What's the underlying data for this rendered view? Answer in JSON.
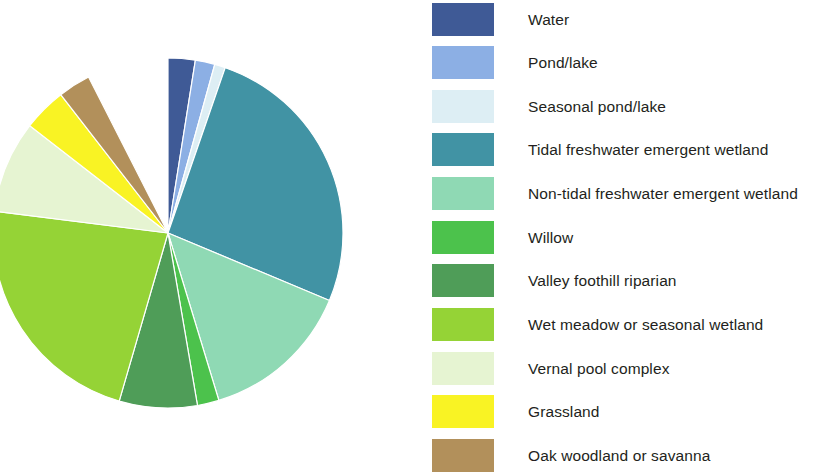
{
  "chart_data": {
    "type": "pie",
    "title": "",
    "subtitle": "",
    "xlabel": "",
    "ylabel": "",
    "legend_position": "right",
    "grid": false,
    "start_angle_deg": 0,
    "direction": "clockwise",
    "categories": [
      "Water",
      "Pond/lake",
      "Seasonal pond/lake",
      "Tidal freshwater emergent wetland",
      "Non-tidal freshwater emergent wetland",
      "Willow",
      "Valley foothill riparian",
      "Wet meadow or seasonal wetland",
      "Vernal pool complex",
      "Grassland",
      "Oak woodland or savanna"
    ],
    "values": [
      2.5,
      1.8,
      1.0,
      26.0,
      14.0,
      2.0,
      7.2,
      22.5,
      8.5,
      4.0,
      3.0
    ],
    "colors": [
      "#3f5a96",
      "#8cafe4",
      "#ddeef4",
      "#4193a4",
      "#8fd9b4",
      "#4cc24c",
      "#4f9d58",
      "#95d336",
      "#e6f4d2",
      "#f9f324",
      "#b2905b"
    ],
    "slices": [
      {
        "label": "Water",
        "value": 2.5,
        "color": "#3f5a96",
        "start_deg": 0.0,
        "end_deg": 9.0
      },
      {
        "label": "Pond/lake",
        "value": 1.8,
        "color": "#8cafe4",
        "start_deg": 9.0,
        "end_deg": 15.5
      },
      {
        "label": "Seasonal pond/lake",
        "value": 1.0,
        "color": "#ddeef4",
        "start_deg": 15.5,
        "end_deg": 19.1
      },
      {
        "label": "Tidal freshwater emergent wetland",
        "value": 26.0,
        "color": "#4193a4",
        "start_deg": 19.1,
        "end_deg": 112.7
      },
      {
        "label": "Non-tidal freshwater emergent wetland",
        "value": 14.0,
        "color": "#8fd9b4",
        "start_deg": 112.7,
        "end_deg": 163.1
      },
      {
        "label": "Willow",
        "value": 2.0,
        "color": "#4cc24c",
        "start_deg": 163.1,
        "end_deg": 170.3
      },
      {
        "label": "Valley foothill riparian",
        "value": 7.2,
        "color": "#4f9d58",
        "start_deg": 170.3,
        "end_deg": 196.2
      },
      {
        "label": "Wet meadow or seasonal wetland",
        "value": 22.5,
        "color": "#95d336",
        "start_deg": 196.2,
        "end_deg": 277.2
      },
      {
        "label": "Vernal pool complex",
        "value": 8.5,
        "color": "#e6f4d2",
        "start_deg": 277.2,
        "end_deg": 307.8
      },
      {
        "label": "Grassland",
        "value": 4.0,
        "color": "#f9f324",
        "start_deg": 307.8,
        "end_deg": 322.2
      },
      {
        "label": "Oak woodland or savanna",
        "value": 3.0,
        "color": "#b2905b",
        "start_deg": 322.2,
        "end_deg": 333.0
      }
    ]
  },
  "pie": {
    "center_x": 168,
    "center_y": 233,
    "radius": 175
  },
  "legend": {
    "items": [
      {
        "label": "Water",
        "color": "#3f5a96",
        "y": 3
      },
      {
        "label": "Pond/lake",
        "color": "#8cafe4",
        "y": 46
      },
      {
        "label": "Seasonal pond/lake",
        "color": "#ddeef4",
        "y": 90
      },
      {
        "label": "Tidal freshwater emergent wetland",
        "color": "#4193a4",
        "y": 133
      },
      {
        "label": "Non-tidal freshwater emergent wetland",
        "color": "#8fd9b4",
        "y": 177
      },
      {
        "label": "Willow",
        "color": "#4cc24c",
        "y": 221
      },
      {
        "label": "Valley foothill riparian",
        "color": "#4f9d58",
        "y": 264
      },
      {
        "label": "Wet meadow or seasonal wetland",
        "color": "#95d336",
        "y": 308
      },
      {
        "label": "Vernal pool complex",
        "color": "#e6f4d2",
        "y": 352
      },
      {
        "label": "Grassland",
        "color": "#f9f324",
        "y": 395
      },
      {
        "label": "Oak woodland or savanna",
        "color": "#b2905b",
        "y": 439
      }
    ]
  }
}
